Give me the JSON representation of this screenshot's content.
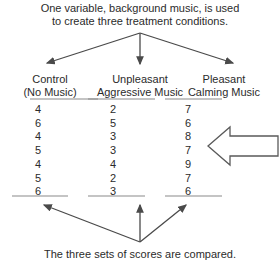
{
  "figure": {
    "top_caption_lines": [
      "One variable, background music, is used",
      "to create three treatment conditions."
    ],
    "bottom_caption": "The three sets of scores are compared.",
    "columns": [
      {
        "header_lines": [
          "Control",
          "(No Music)"
        ],
        "values": [
          "4",
          "6",
          "4",
          "5",
          "4",
          "5",
          "6"
        ]
      },
      {
        "header_lines": [
          "Unpleasant",
          "Aggressive Music"
        ],
        "values": [
          "2",
          "5",
          "3",
          "3",
          "4",
          "2",
          "3"
        ]
      },
      {
        "header_lines": [
          "Pleasant",
          "Calming Music"
        ],
        "values": [
          "7",
          "6",
          "8",
          "7",
          "9",
          "7",
          "6"
        ]
      }
    ],
    "annotation_arrow": {
      "direction": "left",
      "shape": "hollow-block-arrow"
    },
    "colors": {
      "background": "#ffffff",
      "text": "#2b2b2b",
      "line": "#4a4a4a"
    }
  }
}
